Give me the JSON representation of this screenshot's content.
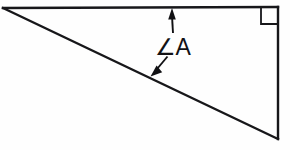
{
  "figure": {
    "kind": "geometry-diagram",
    "background_color": "#fefefe",
    "line_color": "#17171a"
  },
  "labels": {
    "angle_a": "∠A"
  },
  "geometry": {
    "triangle": {
      "type": "right-triangle",
      "vertices": {
        "left_apex": {
          "x": 3,
          "y": 8
        },
        "top_right": {
          "x": 278,
          "y": 7
        },
        "bottom_right": {
          "x": 278,
          "y": 139
        }
      },
      "edges": [
        {
          "name": "top-horizontal-leg",
          "from": "left_apex",
          "to": "top_right"
        },
        {
          "name": "right-vertical-leg",
          "from": "top_right",
          "to": "bottom_right"
        },
        {
          "name": "hypotenuse",
          "from": "left_apex",
          "to": "bottom_right"
        }
      ],
      "stroke_width": 2.4
    },
    "right_angle_marker": {
      "name": "right-angle-square",
      "corner": "top_right",
      "x": 261,
      "y": 8,
      "size": 16
    },
    "leaders": [
      {
        "name": "leader-to-top-leg",
        "direction": "up",
        "from": {
          "x": 173,
          "y": 32
        },
        "to": {
          "x": 172,
          "y": 9
        }
      },
      {
        "name": "leader-to-hypotenuse",
        "direction": "down-left",
        "from": {
          "x": 167,
          "y": 57
        },
        "to": {
          "x": 151,
          "y": 76
        }
      }
    ],
    "label_position": {
      "x": 155,
      "y": 55
    }
  }
}
